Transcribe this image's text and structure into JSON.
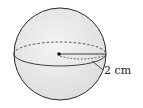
{
  "figure": {
    "shape": "sphere",
    "radius_label": "2 cm",
    "colors": {
      "fill": "#ececec",
      "stroke": "#2a2a2a"
    }
  }
}
